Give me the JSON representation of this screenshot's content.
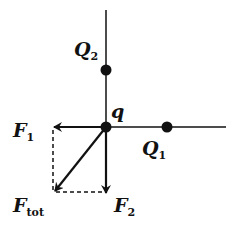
{
  "diagram": {
    "title": "",
    "labels": {
      "Q2": {
        "main": "Q",
        "sub": "2"
      },
      "q": {
        "main": "q",
        "sub": ""
      },
      "Q1": {
        "main": "Q",
        "sub": "1"
      },
      "F1": {
        "main": "F",
        "sub": "1"
      },
      "F2": {
        "main": "F",
        "sub": "2"
      },
      "Ftot": {
        "main": "F",
        "sub": "tot"
      }
    },
    "colors": {
      "ink": "#111111",
      "background": "#ffffff"
    }
  }
}
